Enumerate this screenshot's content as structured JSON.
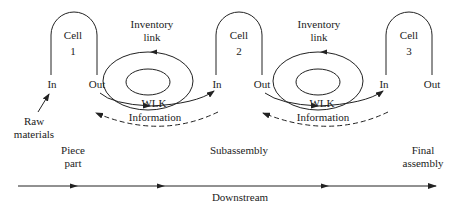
{
  "diagram": {
    "cells": [
      {
        "title": "Cell",
        "number": "1",
        "in_label": "In",
        "out_label": "Out"
      },
      {
        "title": "Cell",
        "number": "2",
        "in_label": "In",
        "out_label": "Out"
      },
      {
        "title": "Cell",
        "number": "3",
        "in_label": "In",
        "out_label": "Out"
      }
    ],
    "links": [
      {
        "title_line1": "Inventory",
        "title_line2": "link",
        "center_label": "WLK",
        "info_label": "Information"
      },
      {
        "title_line1": "Inventory",
        "title_line2": "link",
        "center_label": "WLK",
        "info_label": "Information"
      }
    ],
    "raw_materials": {
      "line1": "Raw",
      "line2": "materials"
    },
    "stages": [
      {
        "line1": "Piece",
        "line2": "part"
      },
      {
        "line1": "Subassembly",
        "line2": ""
      },
      {
        "line1": "Final",
        "line2": "assembly"
      }
    ],
    "axis_label": "Downstream",
    "colors": {
      "stroke": "#222222",
      "background": "#ffffff"
    }
  }
}
